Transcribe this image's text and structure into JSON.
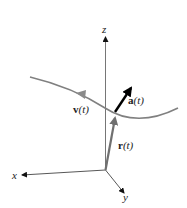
{
  "diagram": {
    "axes": {
      "x_label": "x",
      "y_label": "y",
      "z_label": "z"
    },
    "vectors": {
      "position": {
        "symbol": "r",
        "arg": "(t)"
      },
      "velocity": {
        "symbol": "v",
        "arg": "(t)"
      },
      "acceleration": {
        "symbol": "a",
        "arg": "(t)"
      }
    },
    "colors": {
      "axis": "#555555",
      "curve": "#808080",
      "position_vector": "#707070",
      "velocity_vector": "#8a8a8a",
      "acceleration_vector": "#000000",
      "label": "#222222"
    }
  }
}
